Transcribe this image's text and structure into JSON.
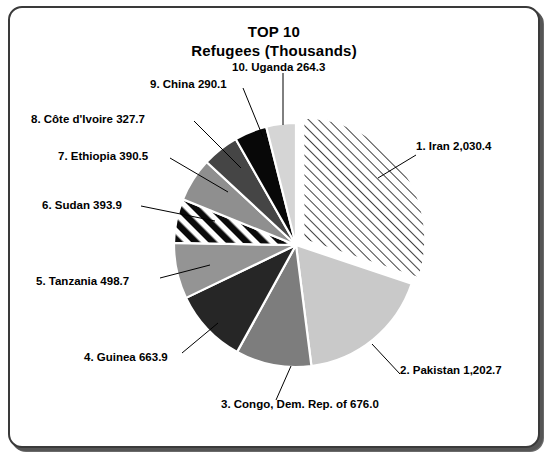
{
  "window": {
    "border_color": "#3a3a3a",
    "background": "#ffffff"
  },
  "header": {
    "title_line1": "TOP 10",
    "title_line2": "Refugees (Thousands)"
  },
  "chart_data": {
    "type": "pie",
    "title": "TOP 10 Refugees (Thousands)",
    "subtitle": "Refugees (Thousands)",
    "unit": "Thousands",
    "xlabel": "",
    "ylabel": "",
    "legend_position": "callout-labels",
    "grid": false,
    "total": 6738.2,
    "start_angle_deg": 0,
    "direction": "clockwise",
    "categories": [
      "Iran",
      "Pakistan",
      "Congo, Dem. Rep. of",
      "Guinea",
      "Tanzania",
      "Sudan",
      "Ethiopia",
      "Côte d'Ivoire",
      "China",
      "Uganda"
    ],
    "values": [
      2030.4,
      1202.7,
      676.0,
      663.9,
      498.7,
      393.9,
      390.5,
      327.7,
      290.1,
      264.3
    ],
    "slices": [
      {
        "rank": "1",
        "name": "Iran",
        "value": 2030.4,
        "value_text": "2,030.4",
        "label": "1. Iran 2,030.4",
        "fill": "hatch-thin",
        "color": "#ffffff",
        "exploded": true,
        "percent": 30.1
      },
      {
        "rank": "2",
        "name": "Pakistan",
        "value": 1202.7,
        "value_text": "1,202.7",
        "label": "2. Pakistan 1,202.7",
        "fill": "solid",
        "color": "#c9c9c9",
        "exploded": false,
        "percent": 17.8
      },
      {
        "rank": "3",
        "name": "Congo, Dem. Rep. of",
        "value": 676.0,
        "value_text": "676.0",
        "label": "3. Congo, Dem. Rep. of  676.0",
        "fill": "solid",
        "color": "#7d7d7d",
        "exploded": false,
        "percent": 10.0
      },
      {
        "rank": "4",
        "name": "Guinea",
        "value": 663.9,
        "value_text": "663.9",
        "label": "4. Guinea 663.9",
        "fill": "solid",
        "color": "#262626",
        "exploded": false,
        "percent": 9.9
      },
      {
        "rank": "5",
        "name": "Tanzania",
        "value": 498.7,
        "value_text": "498.7",
        "label": "5. Tanzania 498.7",
        "fill": "solid",
        "color": "#949494",
        "exploded": false,
        "percent": 7.4
      },
      {
        "rank": "6",
        "name": "Sudan",
        "value": 393.9,
        "value_text": "393.9",
        "label": "6. Sudan 393.9",
        "fill": "hatch-thick",
        "color": "#ffffff",
        "exploded": false,
        "percent": 5.8
      },
      {
        "rank": "7",
        "name": "Ethiopia",
        "value": 390.5,
        "value_text": "390.5",
        "label": "7. Ethiopia 390.5",
        "fill": "solid",
        "color": "#8f8f8f",
        "exploded": false,
        "percent": 5.8
      },
      {
        "rank": "8",
        "name": "Côte d'Ivoire",
        "value": 327.7,
        "value_text": "327.7",
        "label": "8. Côte d'Ivoire 327.7",
        "fill": "solid",
        "color": "#454545",
        "exploded": false,
        "percent": 4.9
      },
      {
        "rank": "9",
        "name": "China",
        "value": 290.1,
        "value_text": "290.1",
        "label": "9. China 290.1",
        "fill": "solid",
        "color": "#080808",
        "exploded": false,
        "percent": 4.3
      },
      {
        "rank": "10",
        "name": "Uganda",
        "value": 264.3,
        "value_text": "264.3",
        "label": "10. Uganda 264.3",
        "fill": "solid",
        "color": "#d5d5d5",
        "exploded": false,
        "percent": 3.9
      }
    ]
  }
}
